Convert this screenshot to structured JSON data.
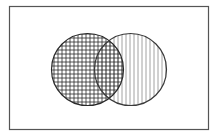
{
  "diagram": {
    "type": "venn",
    "universe": {
      "x": 9,
      "y": 6,
      "width": 199,
      "height": 123,
      "stroke": "#555555"
    },
    "sets": [
      {
        "id": "A",
        "label": "",
        "cx": 87.5,
        "cy": 69.5,
        "r": 36,
        "pattern": "crosshatch",
        "stroke": "#333333",
        "hatch_color": "#333333"
      },
      {
        "id": "B",
        "label": "",
        "cx": 130.5,
        "cy": 69.5,
        "r": 36,
        "pattern": "vertical-lines",
        "stroke": "#444444",
        "hatch_color": "#888888"
      }
    ],
    "hatch_spacing": 4
  }
}
